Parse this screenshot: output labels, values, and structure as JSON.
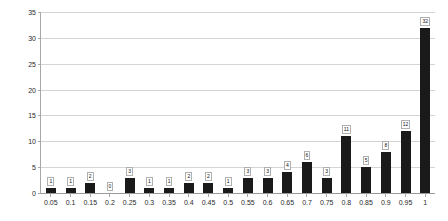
{
  "chart_data": {
    "type": "bar",
    "title": "",
    "subtitle": "",
    "xlabel": "",
    "ylabel": "",
    "categories": [
      "0.05",
      "0.1",
      "0.15",
      "0.2",
      "0.25",
      "0.3",
      "0.35",
      "0.4",
      "0.45",
      "0.5",
      "0.55",
      "0.6",
      "0.65",
      "0.7",
      "0.75",
      "0.8",
      "0.85",
      "0.9",
      "0.95",
      "1"
    ],
    "values": [
      1,
      1,
      2,
      0,
      3,
      1,
      1,
      2,
      2,
      1,
      3,
      3,
      4,
      6,
      3,
      11,
      5,
      8,
      12,
      32
    ],
    "data_labels": [
      "1",
      "1",
      "2",
      "0",
      "3",
      "1",
      "1",
      "2",
      "2",
      "1",
      "3",
      "3",
      "4",
      "6",
      "3",
      "11",
      "5",
      "8",
      "12",
      "32"
    ],
    "ylim": [
      0,
      35
    ],
    "y_ticks": [
      "0",
      "5",
      "10",
      "15",
      "20",
      "25",
      "30",
      "35"
    ],
    "grid": true,
    "legend": "none",
    "series": [
      {
        "name": "",
        "values": [
          1,
          1,
          2,
          0,
          3,
          1,
          1,
          2,
          2,
          1,
          3,
          3,
          4,
          6,
          3,
          11,
          5,
          8,
          12,
          32
        ]
      }
    ],
    "colors": {
      "bar": "#1a1a1a",
      "gridline": "#d4d4d4",
      "axis": "#a8a8a8",
      "label_text": "#2b2b2b",
      "plot_background": "#ffffff"
    }
  }
}
